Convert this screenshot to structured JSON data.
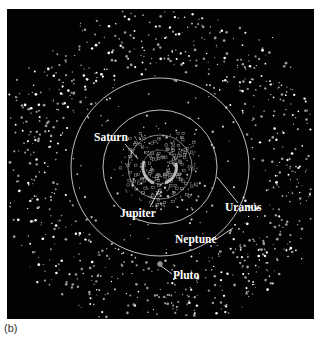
{
  "figure": {
    "caption": "(b)",
    "background_color": "#020202",
    "orbit_color": "#e8e8e8",
    "center": [
      153,
      158
    ],
    "orbits": [
      {
        "name": "Jupiter",
        "radius": 17
      },
      {
        "name": "Saturn",
        "radius": 32
      },
      {
        "name": "Uranus",
        "radius": 57
      },
      {
        "name": "Neptune",
        "radius": 89
      }
    ],
    "labels": [
      {
        "text": "Saturn",
        "x": 87,
        "y": 132,
        "lx1": 118,
        "ly1": 135,
        "lx2": 131,
        "ly2": 150
      },
      {
        "text": "Jupiter",
        "x": 113,
        "y": 208,
        "lx1": 143,
        "ly1": 198,
        "lx2": 152,
        "ly2": 181
      },
      {
        "text": "Uranus",
        "x": 218,
        "y": 202,
        "lx1": 231,
        "ly1": 194,
        "lx2": 210,
        "ly2": 168
      },
      {
        "text": "Neptune",
        "x": 168,
        "y": 234,
        "lx1": 208,
        "ly1": 231,
        "lx2": 226,
        "ly2": 219
      },
      {
        "text": "Pluto",
        "x": 166,
        "y": 270,
        "lx1": 165,
        "ly1": 265,
        "lx2": 154,
        "ly2": 257
      }
    ],
    "pluto": {
      "x": 153,
      "y": 255
    }
  }
}
